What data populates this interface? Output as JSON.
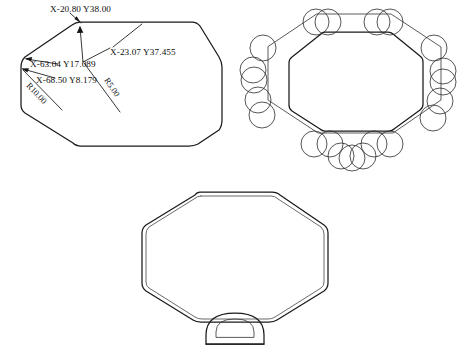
{
  "drawing": {
    "title": "Octagonal Part CAD Drawing",
    "background_color": "#ffffff",
    "line_color": "#1a1a1a",
    "secondary_line_color": "#5a5a5a",
    "views": [
      {
        "id": "plan-dimensioned",
        "name": "Dimensioned Plan View",
        "shape": "rounded-octagon"
      },
      {
        "id": "toolpath",
        "name": "Toolpath Circles View",
        "shape": "octagon-with-cutter-circles"
      },
      {
        "id": "offset-profile",
        "name": "Offset Profile View with Base",
        "shape": "double-outline-octagon-with-dome-base"
      }
    ]
  },
  "annotations": {
    "point_top": {
      "label": "X-20.80   Y38.00",
      "x_value": "X-20.80",
      "y_value": "Y38.00"
    },
    "point_top_right": {
      "label": "X-23.07   Y37.455",
      "x_value": "X-23.07",
      "y_value": "Y37.455"
    },
    "point_left_upper": {
      "label": "X-63.04   Y17.089",
      "x_value": "X-63.04",
      "y_value": "Y17.089"
    },
    "point_left_lower": {
      "label": "X-68.50   Y8.179",
      "x_value": "X-68.50",
      "y_value": "Y8.179"
    },
    "radius_large": {
      "label": "R10.00",
      "value": "10.00"
    },
    "radius_small": {
      "label": "R5.00",
      "value": "5.00"
    }
  }
}
